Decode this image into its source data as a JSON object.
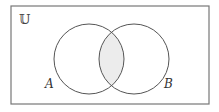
{
  "diagram": {
    "type": "venn",
    "universe_label": "𝕌",
    "sets": [
      {
        "name": "A",
        "label": "A",
        "cx": 89,
        "cy": 59,
        "r": 35
      },
      {
        "name": "B",
        "label": "B",
        "cx": 134,
        "cy": 59,
        "r": 35
      }
    ],
    "shaded_region": "A ∩ B",
    "colors": {
      "stroke": "#555555",
      "frame": "#777777",
      "shade": "#ececec",
      "background": "#ffffff"
    }
  }
}
